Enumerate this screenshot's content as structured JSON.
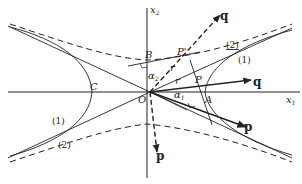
{
  "diagram": {
    "colors": {
      "ink": "#222222",
      "background": "#ffffff"
    },
    "axes": {
      "x1_label": "x",
      "x1_sub": "1",
      "x2_label": "x",
      "x2_sub": "2"
    },
    "points": {
      "origin": "O",
      "B": "B",
      "P_prime": "P'",
      "P": "P",
      "A": "A",
      "C": "C"
    },
    "vectors": {
      "q_upper": "q",
      "q_right": "q",
      "p_right": "p",
      "p_down": "p"
    },
    "segments": {
      "r_upper": "r",
      "r_right": "r"
    },
    "angles": {
      "alpha1": "α",
      "alpha1_sub": "1",
      "alpha2": "α",
      "alpha2_sub": "2"
    },
    "curve_labels": {
      "upper_right_1": "(1)",
      "upper_right_2": "(2)",
      "lower_left_1": "(1)",
      "lower_left_2": "(2)"
    }
  }
}
